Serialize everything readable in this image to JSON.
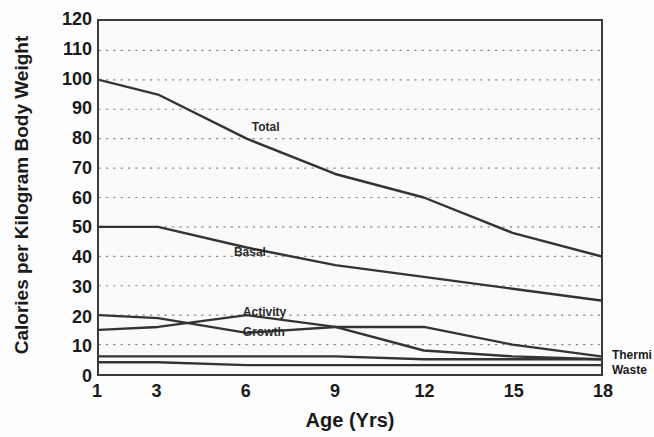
{
  "chart_data": {
    "type": "line",
    "title": "",
    "xlabel": "Age (Yrs)",
    "ylabel": "Calories per Kilogram Body Weight",
    "xlim": [
      1,
      18
    ],
    "ylim": [
      0,
      120
    ],
    "xticks": [
      1,
      3,
      6,
      9,
      12,
      15,
      18
    ],
    "yticks": [
      0,
      10,
      20,
      30,
      40,
      50,
      60,
      70,
      80,
      90,
      100,
      110,
      120
    ],
    "grid": "horizontal-dotted",
    "legend": "inline-labels",
    "series": [
      {
        "name": "Total",
        "label_x": 6.2,
        "label_y": 86,
        "x": [
          1,
          3,
          6,
          9,
          12,
          15,
          18
        ],
        "values": [
          100,
          95,
          80,
          68,
          60,
          48,
          40
        ]
      },
      {
        "name": "Basal",
        "label_x": 5.6,
        "label_y": 44,
        "x": [
          1,
          3,
          6,
          9,
          12,
          15,
          18
        ],
        "values": [
          50,
          50,
          43,
          37,
          33,
          29,
          25
        ]
      },
      {
        "name": "Activity",
        "label_x": 5.9,
        "label_y": 24,
        "x": [
          1,
          3,
          6,
          9,
          12,
          15,
          18
        ],
        "values": [
          20,
          19,
          14,
          16,
          16,
          10,
          6
        ]
      },
      {
        "name": "Growth",
        "label_x": 5.9,
        "label_y": 17,
        "x": [
          1,
          3,
          6,
          9,
          12,
          15,
          18
        ],
        "values": [
          15,
          16,
          20,
          16,
          8,
          6,
          5
        ]
      },
      {
        "name": "Thermic",
        "label_x": 18.3,
        "label_y": 7,
        "x": [
          1,
          3,
          6,
          9,
          12,
          15,
          18
        ],
        "values": [
          6,
          6,
          6,
          6,
          5,
          5,
          5
        ]
      },
      {
        "name": "Waste",
        "label_x": 18.3,
        "label_y": 2,
        "x": [
          1,
          3,
          6,
          9,
          12,
          15,
          18
        ],
        "values": [
          4,
          4,
          3,
          3,
          3,
          3,
          3
        ]
      }
    ]
  },
  "axis": {
    "ytick_labels": [
      "120",
      "110",
      "100",
      "90",
      "80",
      "70",
      "60",
      "50",
      "40",
      "30",
      "20",
      "10",
      "0"
    ],
    "xtick_labels": [
      "1",
      "3",
      "6",
      "9",
      "12",
      "15",
      "18"
    ],
    "y_title": "Calories per Kilogram Body Weight",
    "x_title": "Age (Yrs)"
  },
  "inline_labels": {
    "total": "Total",
    "basal": "Basal",
    "activity": "Activity",
    "growth": "Growth"
  },
  "edge_labels": {
    "thermic": "Thermi",
    "waste": "Waste"
  },
  "colors": {
    "line": "#333333",
    "grid": "#8a8a8a",
    "frame": "#3a3a3a",
    "text": "#1a1a1a",
    "plot_bg": "#fafafa",
    "page_bg": "#fdfdfd"
  }
}
